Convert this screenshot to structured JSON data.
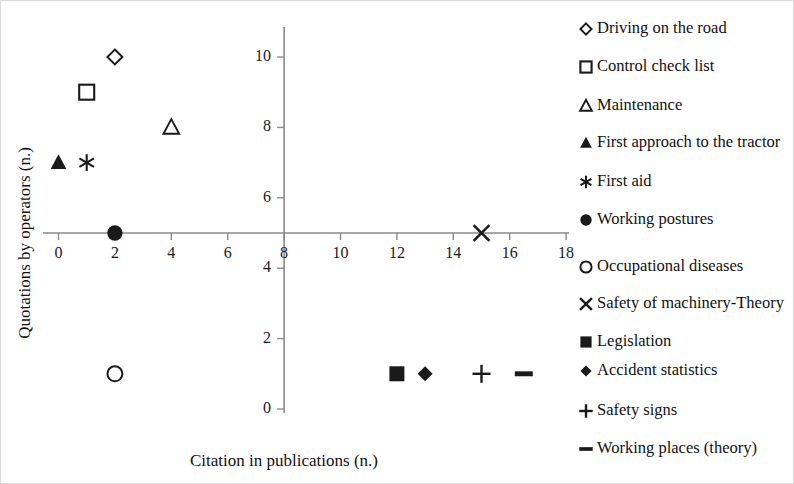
{
  "chart_data": {
    "type": "scatter",
    "title": "",
    "xlabel": "Citation in publications (n.)",
    "ylabel": "Quotations by operators (n.)",
    "xlim": [
      -1,
      18.8
    ],
    "ylim": [
      0,
      10.9
    ],
    "xticks": [
      0,
      2,
      4,
      6,
      8,
      10,
      12,
      14,
      16,
      18
    ],
    "yticks": [
      0,
      2,
      4,
      6,
      8,
      10
    ],
    "xtick_labels": [
      "0",
      "2",
      "4",
      "6",
      "8",
      "10",
      "12",
      "14",
      "16",
      "18"
    ],
    "ytick_labels": [
      "0",
      "2",
      "4",
      "6",
      "8",
      "10"
    ],
    "grid": false,
    "legend_position": "right",
    "axis_origin": {
      "x": 8,
      "y": 5
    },
    "series": [
      {
        "name": "Driving on the road",
        "marker": "diamond-open",
        "x": 2,
        "y": 10
      },
      {
        "name": "Control check list",
        "marker": "square-open",
        "x": 1,
        "y": 9
      },
      {
        "name": "Maintenance",
        "marker": "triangle-open",
        "x": 4,
        "y": 8
      },
      {
        "name": "First approach to the tractor",
        "marker": "triangle-filled",
        "x": 0,
        "y": 7
      },
      {
        "name": "First aid",
        "marker": "asterisk",
        "x": 1,
        "y": 7
      },
      {
        "name": "Working postures",
        "marker": "circle-filled",
        "x": 2,
        "y": 5
      },
      {
        "name": "Occupational diseases",
        "marker": "circle-open",
        "x": 2,
        "y": 1
      },
      {
        "name": "Safety of machinery-Theory",
        "marker": "cross-x",
        "x": 15,
        "y": 5
      },
      {
        "name": "Legislation",
        "marker": "square-filled",
        "x": 12,
        "y": 1
      },
      {
        "name": "Accident statistics",
        "marker": "diamond-filled",
        "x": 13,
        "y": 1
      },
      {
        "name": "Safety signs",
        "marker": "plus",
        "x": 15,
        "y": 1
      },
      {
        "name": "Working places (theory)",
        "marker": "dash",
        "x": 16.5,
        "y": 1
      }
    ]
  },
  "axes": {
    "x_title": "Citation in publications (n.)",
    "y_title": "Quotations by operators (n.)",
    "x_tick_0": "0",
    "x_tick_1": "2",
    "x_tick_2": "4",
    "x_tick_3": "6",
    "x_tick_4": "8",
    "x_tick_5": "10",
    "x_tick_6": "12",
    "x_tick_7": "14",
    "x_tick_8": "16",
    "x_tick_9": "18",
    "y_tick_0": "0",
    "y_tick_1": "2",
    "y_tick_2": "4",
    "y_tick_3": "6",
    "y_tick_4": "8",
    "y_tick_5": "10"
  },
  "legend": {
    "items": [
      {
        "label": "Driving on the road",
        "marker": "diamond-open"
      },
      {
        "label": "Control check list",
        "marker": "square-open"
      },
      {
        "label": "Maintenance",
        "marker": "triangle-open"
      },
      {
        "label": "First approach to the tractor",
        "marker": "triangle-filled"
      },
      {
        "label": "First aid",
        "marker": "asterisk"
      },
      {
        "label": "Working postures",
        "marker": "circle-filled"
      },
      {
        "label": "Occupational diseases",
        "marker": "circle-open"
      },
      {
        "label": "Safety of machinery-Theory",
        "marker": "cross-x"
      },
      {
        "label": "Legislation",
        "marker": "square-filled"
      },
      {
        "label": "Accident statistics",
        "marker": "diamond-filled"
      },
      {
        "label": "Safety signs",
        "marker": "plus"
      },
      {
        "label": "Working places (theory)",
        "marker": "dash"
      }
    ]
  },
  "colors": {
    "marker": "#1a1a1a",
    "axis": "#8a8a8a",
    "text": "#111111",
    "frame": "#d9d9d9",
    "background": "#ffffff"
  }
}
